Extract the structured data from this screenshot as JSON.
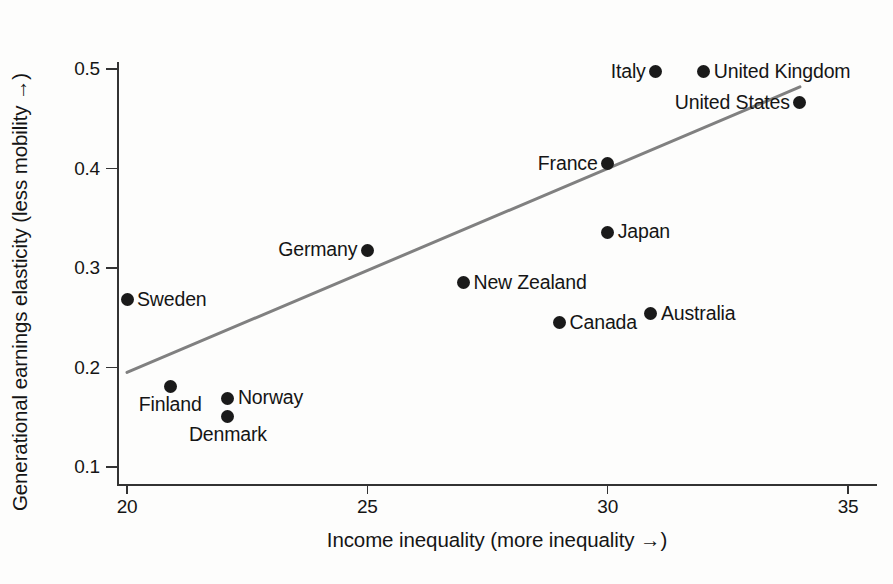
{
  "chart_data": {
    "type": "scatter",
    "title": "",
    "subtitle": "",
    "xlabel": "Income inequality (more inequality →)",
    "ylabel": "Generational earnings elasticity (less mobility →)",
    "xlim": [
      19.2,
      35.6
    ],
    "ylim": [
      0.085,
      0.525
    ],
    "xticks": [
      20,
      25,
      30,
      35
    ],
    "xtick_labels": [
      "20",
      "25",
      "30",
      "35"
    ],
    "yticks": [
      0.1,
      0.2,
      0.3,
      0.4,
      0.5
    ],
    "ytick_labels": [
      "0.1",
      "0.2",
      "0.3",
      "0.4",
      "0.5"
    ],
    "grid": false,
    "legend": null,
    "marker_color": "#1a1a1a",
    "trendline_color": "#808080",
    "points": [
      {
        "label": "Sweden",
        "x": 20.0,
        "y": 0.268,
        "label_pos": "right"
      },
      {
        "label": "Finland",
        "x": 20.9,
        "y": 0.181,
        "label_pos": "below"
      },
      {
        "label": "Norway",
        "x": 22.1,
        "y": 0.169,
        "label_pos": "right"
      },
      {
        "label": "Denmark",
        "x": 22.1,
        "y": 0.151,
        "label_pos": "below"
      },
      {
        "label": "Germany",
        "x": 25.0,
        "y": 0.318,
        "label_pos": "left"
      },
      {
        "label": "New Zealand",
        "x": 27.0,
        "y": 0.285,
        "label_pos": "right"
      },
      {
        "label": "Canada",
        "x": 29.0,
        "y": 0.245,
        "label_pos": "right"
      },
      {
        "label": "France",
        "x": 30.0,
        "y": 0.405,
        "label_pos": "left"
      },
      {
        "label": "Japan",
        "x": 30.0,
        "y": 0.336,
        "label_pos": "right"
      },
      {
        "label": "Australia",
        "x": 30.9,
        "y": 0.254,
        "label_pos": "right"
      },
      {
        "label": "Italy",
        "x": 31.0,
        "y": 0.497,
        "label_pos": "left"
      },
      {
        "label": "United Kingdom",
        "x": 32.0,
        "y": 0.497,
        "label_pos": "right"
      },
      {
        "label": "United States",
        "x": 34.0,
        "y": 0.466,
        "label_pos": "left"
      }
    ],
    "trendline": {
      "x0": 20.0,
      "y0": 0.195,
      "x1": 34.0,
      "y1": 0.482
    }
  }
}
